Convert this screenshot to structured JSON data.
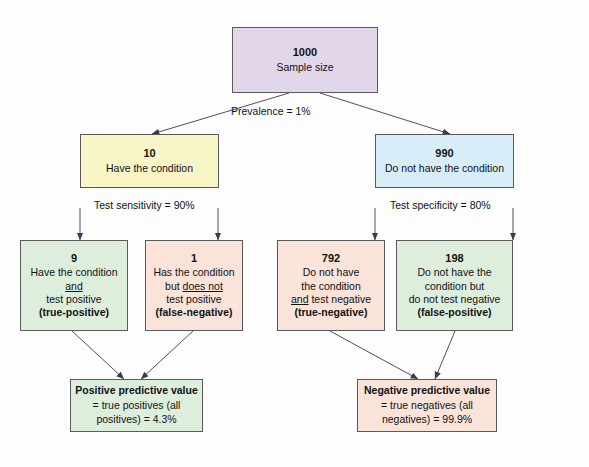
{
  "diagram": {
    "colors": {
      "root": "#e2d6ea",
      "condition_yes": "#f8f5c6",
      "condition_no": "#d7edf7",
      "green": "#ddeedd",
      "pink": "#fae3d9",
      "border": "#5a5a5a",
      "arrow": "#3a3a52",
      "background": "#fdfdfd"
    },
    "root": {
      "number": "1000",
      "label": "Sample size"
    },
    "prevalence_label": "Prevalence = 1%",
    "branches": [
      {
        "number": "10",
        "label": "Have the condition",
        "test_label": "Test sensitivity = 90%"
      },
      {
        "number": "990",
        "label": "Do not have the condition",
        "test_label": "Test specificity = 80%"
      }
    ],
    "outcomes": [
      {
        "number": "9",
        "lines": [
          [
            {
              "t": "Have the condition",
              "u": false
            }
          ],
          [
            {
              "t": "and",
              "u": true
            }
          ],
          [
            {
              "t": "test positive",
              "u": false
            }
          ]
        ],
        "tag": "(true-positive)"
      },
      {
        "number": "1",
        "lines": [
          [
            {
              "t": "Has the condition",
              "u": false
            }
          ],
          [
            {
              "t": "but ",
              "u": false
            },
            {
              "t": "does not",
              "u": true
            }
          ],
          [
            {
              "t": "test positive",
              "u": false
            }
          ]
        ],
        "tag": "(false-negative)"
      },
      {
        "number": "792",
        "lines": [
          [
            {
              "t": "Do not have",
              "u": false
            }
          ],
          [
            {
              "t": "the condition",
              "u": false
            }
          ],
          [
            {
              "t": "and",
              "u": true
            },
            {
              "t": " test negative",
              "u": false
            }
          ]
        ],
        "tag": "(true-negative)"
      },
      {
        "number": "198",
        "lines": [
          [
            {
              "t": "Do not have the",
              "u": false
            }
          ],
          [
            {
              "t": "condition but",
              "u": false
            }
          ],
          [
            {
              "t": "do not test negative",
              "u": false
            }
          ]
        ],
        "tag": "(false-positive)"
      }
    ],
    "summaries": [
      {
        "head": "Positive predictive value",
        "lines": [
          "= true positives (all",
          "positives) = 4.3%"
        ]
      },
      {
        "head": "Negative predictive value",
        "lines": [
          "= true negatives (all",
          "negatives) = 99.9%"
        ]
      }
    ]
  }
}
